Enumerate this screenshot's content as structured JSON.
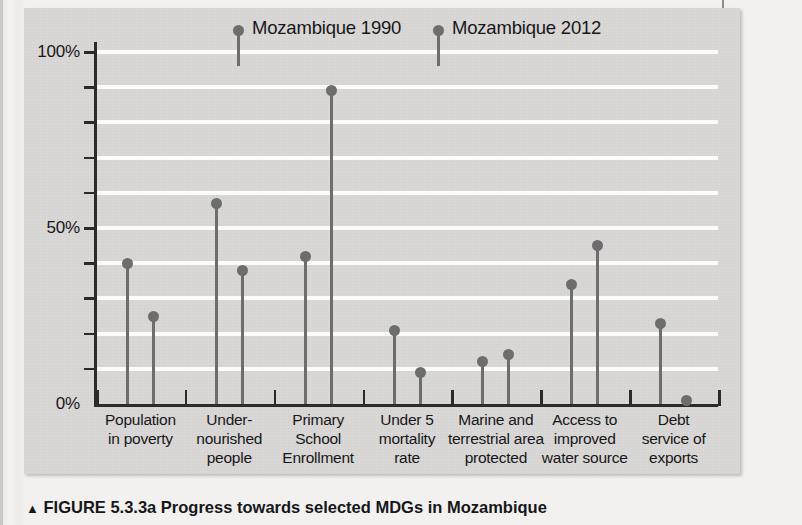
{
  "figure": {
    "caption_marker": "▲",
    "caption_label": "FIGURE 5.3.3a",
    "caption_text": "Progress towards selected MDGs in Mozambique"
  },
  "legend": {
    "position": "top-inside",
    "entries": [
      {
        "label": "Mozambique 1990",
        "color": "#6d6d6d"
      },
      {
        "label": "Mozambique 2012",
        "color": "#6d6d6d"
      }
    ]
  },
  "axis": {
    "y_labels": [
      "100%",
      "50%",
      "0%"
    ],
    "y_label_values": [
      100,
      50,
      0
    ],
    "y_tick_values": [
      0,
      10,
      20,
      30,
      40,
      50,
      60,
      70,
      80,
      90,
      100
    ]
  },
  "chart_data": {
    "type": "lollipop",
    "title": "Progress towards selected MDGs in Mozambique",
    "xlabel": "",
    "ylabel": "",
    "ylim": [
      0,
      100
    ],
    "grid": true,
    "legend_position": "top",
    "categories": [
      "Population\nin poverty",
      "Under-\nnourished\npeople",
      "Primary\nSchool\nEnrollment",
      "Under 5\nmortality\nrate",
      "Marine and\nterrestrial area\nprotected",
      "Access to\nimproved\nwater source",
      "Debt\nservice of\nexports"
    ],
    "category_lines": [
      [
        "Population",
        "in poverty"
      ],
      [
        "Under-",
        "nourished",
        "people"
      ],
      [
        "Primary",
        "School",
        "Enrollment"
      ],
      [
        "Under 5",
        "mortality",
        "rate"
      ],
      [
        "Marine and",
        "terrestrial area",
        "protected"
      ],
      [
        "Access to",
        "improved",
        "water source"
      ],
      [
        "Debt",
        "service of",
        "exports"
      ]
    ],
    "series": [
      {
        "name": "Mozambique 1990",
        "values": [
          40,
          57,
          42,
          21,
          12,
          34,
          23
        ]
      },
      {
        "name": "Mozambique 2012",
        "values": [
          25,
          38,
          89,
          9,
          14,
          45,
          1
        ]
      }
    ]
  }
}
